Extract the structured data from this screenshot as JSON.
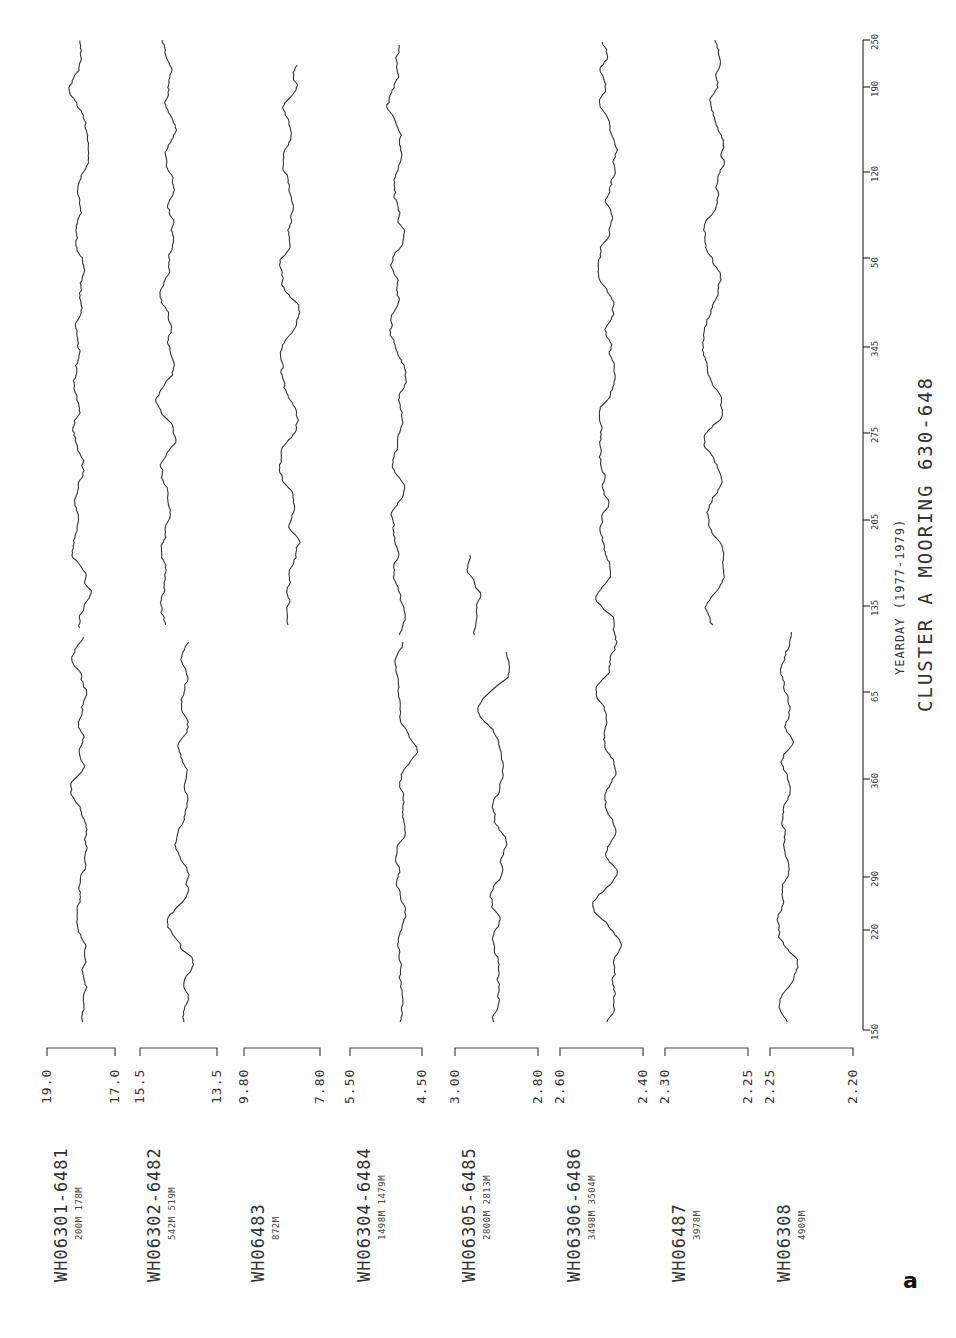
{
  "figure_letter": "a",
  "chart_data": {
    "type": "line",
    "title": "CLUSTER A MOORING 630-648",
    "xlabel": "YEARDAY (1977-1979)",
    "ylabel": "",
    "orientation": "page rotated 90°: time axis vertical (150 at bottom, 250 at top), series stacked left-to-right",
    "x_ticks": [
      "150",
      "220",
      "290",
      "360",
      "65",
      "135",
      "205",
      "275",
      "345",
      "50",
      "120",
      "190",
      "250"
    ],
    "grid": false,
    "legend": "none (each series labeled at panel start)",
    "series": [
      {
        "name": "WH06301-6481",
        "depths": "200M 178M",
        "ylim": [
          17.0,
          19.0
        ],
        "scale_top": "19.0",
        "scale_bottom": "17.0",
        "note": "two stacked segments",
        "x_range": [
          150,
          250
        ]
      },
      {
        "name": "WH06302-6482",
        "depths": "542M 519M",
        "ylim": [
          13.5,
          15.5
        ],
        "scale_top": "15.5",
        "scale_bottom": "13.5",
        "note": "two segments with gap near day 135",
        "x_range": [
          150,
          250
        ]
      },
      {
        "name": "WH06483",
        "depths": "872M",
        "ylim": [
          7.8,
          9.8
        ],
        "scale_top": "9.80",
        "scale_bottom": "7.80",
        "note": "record begins near day 135 (second year)",
        "x_range": [
          135,
          250
        ]
      },
      {
        "name": "WH06304-6484",
        "depths": "1498M 1479M",
        "ylim": [
          4.5,
          5.5
        ],
        "scale_top": "5.50",
        "scale_bottom": "4.50",
        "x_range": [
          150,
          250
        ]
      },
      {
        "name": "WH06305-6485",
        "depths": "2800M 2813M",
        "ylim": [
          2.8,
          3.0
        ],
        "scale_top": "3.00",
        "scale_bottom": "2.80",
        "note": "record ends near day 205 (second year)",
        "x_range": [
          150,
          205
        ]
      },
      {
        "name": "WH06306-6486",
        "depths": "3498M 3504M",
        "ylim": [
          2.4,
          2.6
        ],
        "scale_top": "2.60",
        "scale_bottom": "2.40",
        "x_range": [
          150,
          250
        ]
      },
      {
        "name": "WH06487",
        "depths": "3978M",
        "ylim": [
          2.25,
          2.3
        ],
        "scale_top": "2.30",
        "scale_bottom": "2.25",
        "note": "record begins near day 135 (second year)",
        "x_range": [
          135,
          250
        ]
      },
      {
        "name": "WH06308",
        "depths": "4909M",
        "ylim": [
          2.2,
          2.25
        ],
        "scale_top": "2.25",
        "scale_bottom": "2.20",
        "note": "record ends near day 135 (second year)",
        "x_range": [
          150,
          135
        ]
      }
    ]
  },
  "panels": [
    {
      "name": "WH06301-6481",
      "depths": "200M 178M",
      "top": "19.0",
      "bottom": "17.0",
      "bracket": [
        47,
        115
      ]
    },
    {
      "name": "WH06302-6482",
      "depths": "542M 519M",
      "top": "15.5",
      "bottom": "13.5",
      "bracket": [
        140,
        217
      ]
    },
    {
      "name": "WH06483",
      "depths": "872M",
      "top": "9.80",
      "bottom": "7.80",
      "bracket": [
        244,
        320
      ]
    },
    {
      "name": "WH06304-6484",
      "depths": "1498M 1479M",
      "top": "5.50",
      "bottom": "4.50",
      "bracket": [
        350,
        422
      ]
    },
    {
      "name": "WH06305-6485",
      "depths": "2800M 2813M",
      "top": "3.00",
      "bottom": "2.80",
      "bracket": [
        455,
        538
      ]
    },
    {
      "name": "WH06306-6486",
      "depths": "3498M 3504M",
      "top": "2.60",
      "bottom": "2.40",
      "bracket": [
        560,
        643
      ]
    },
    {
      "name": "WH06487",
      "depths": "3978M",
      "top": "2.30",
      "bottom": "2.25",
      "bracket": [
        665,
        748
      ]
    },
    {
      "name": "WH06308",
      "depths": "4909M",
      "top": "2.25",
      "bottom": "2.20",
      "bracket": [
        770,
        853
      ]
    }
  ],
  "traces": [
    {
      "segments": [
        [
          1022,
          635,
          60,
          105,
          11
        ],
        [
          628,
          40,
          55,
          105,
          12
        ]
      ]
    },
    {
      "segments": [
        [
          1022,
          640,
          160,
          210,
          21
        ],
        [
          625,
          38,
          130,
          205,
          22
        ]
      ]
    },
    {
      "segments": [
        [
          625,
          65,
          262,
          315,
          31
        ]
      ]
    },
    {
      "segments": [
        [
          1022,
          640,
          380,
          420,
          41
        ],
        [
          635,
          45,
          375,
          420,
          42
        ]
      ]
    },
    {
      "segments": [
        [
          1022,
          650,
          478,
          512,
          51
        ],
        [
          635,
          555,
          462,
          486,
          52
        ]
      ]
    },
    {
      "segments": [
        [
          1022,
          40,
          585,
          630,
          61
        ]
      ]
    },
    {
      "segments": [
        [
          625,
          40,
          670,
          760,
          71
        ]
      ]
    },
    {
      "segments": [
        [
          1022,
          630,
          762,
          810,
          81
        ]
      ]
    }
  ],
  "axis": {
    "x": 863,
    "y_bottom": 1030,
    "y_top": 40,
    "ticks": [
      {
        "label": "150",
        "y": 1030
      },
      {
        "label": "220",
        "y": 930
      },
      {
        "label": "290",
        "y": 877
      },
      {
        "label": "360",
        "y": 779
      },
      {
        "label": "65",
        "y": 692
      },
      {
        "label": "135",
        "y": 606
      },
      {
        "label": "205",
        "y": 520
      },
      {
        "label": "275",
        "y": 433
      },
      {
        "label": "345",
        "y": 347
      },
      {
        "label": "50",
        "y": 258
      },
      {
        "label": "120",
        "y": 172
      },
      {
        "label": "190",
        "y": 87
      },
      {
        "label": "250",
        "y": 40
      }
    ],
    "xlabel": "YEARDAY (1977-1979)",
    "title": "CLUSTER A MOORING 630-648"
  }
}
